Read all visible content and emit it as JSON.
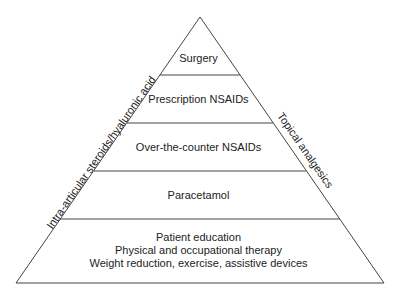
{
  "diagram": {
    "type": "pyramid",
    "tiers": [
      {
        "label": "Surgery"
      },
      {
        "label": "Prescription NSAIDs"
      },
      {
        "label": "Over-the-counter NSAIDs"
      },
      {
        "label": "Paracetamol"
      },
      {
        "lines": [
          "Patient education",
          "Physical and occupational therapy",
          "Weight reduction, exercise, assistive devices"
        ]
      }
    ],
    "left_side_label": "Intra-articular steroids/hyaluronic acid",
    "right_side_label": "Topical analgesics",
    "line_color": "#444444"
  }
}
